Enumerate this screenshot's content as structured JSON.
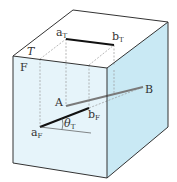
{
  "figure": {
    "type": "3d-box-projection-diagram",
    "colors": {
      "background": "#ffffff",
      "front_face": "#e6f4fa",
      "right_face": "#c9e9f4",
      "top_face": "#ffffff",
      "edge": "#333333",
      "dashed": "#8a8a8a",
      "segment_true": "#7a7a7a",
      "segment_projection": "#111111"
    },
    "labels": {
      "top_plane": "T",
      "front_plane": "F",
      "point_A": "A",
      "point_B": "B",
      "aT_main": "a",
      "aT_sub": "T",
      "bT_main": "b",
      "bT_sub": "T",
      "aF_main": "a",
      "aF_sub": "F",
      "bF_main": "b",
      "bF_sub": "F",
      "theta_main": "θ",
      "theta_sub": "T"
    },
    "vertices": {
      "top_back_left": [
        73,
        10
      ],
      "top_back_right": [
        168,
        22
      ],
      "top_front_left": [
        13,
        56
      ],
      "top_front_right": [
        107,
        68
      ],
      "bottom_front_left": [
        13,
        163
      ],
      "bottom_front_right": [
        107,
        178
      ],
      "bottom_back_right": [
        168,
        127
      ]
    },
    "points": {
      "aT": [
        66,
        39
      ],
      "bT": [
        114,
        45
      ],
      "A": [
        66,
        106
      ],
      "B": [
        143,
        87
      ],
      "aF": [
        40,
        127
      ],
      "bF": [
        89,
        108
      ]
    }
  }
}
